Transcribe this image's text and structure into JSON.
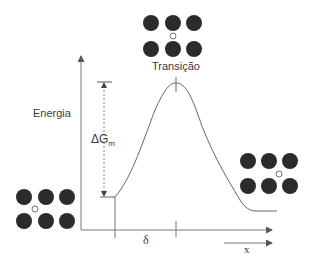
{
  "diagram": {
    "y_axis_label": "Energia",
    "x_axis_label": "x",
    "transition_label": "Transição",
    "barrier_label_main": "ΔG",
    "barrier_label_sub": "m",
    "distance_label": "δ",
    "colors": {
      "atom_fill": "#2b2b2b",
      "line": "#555555",
      "text": "#3a3a3a",
      "background": "#ffffff"
    },
    "lattice_configs": [
      {
        "name": "initial",
        "position": "bottom-left",
        "small_atom_between": "bottom-left gap"
      },
      {
        "name": "transition",
        "position": "top-center",
        "small_atom_between": "center gap"
      },
      {
        "name": "final",
        "position": "right",
        "small_atom_between": "right gap"
      }
    ]
  }
}
